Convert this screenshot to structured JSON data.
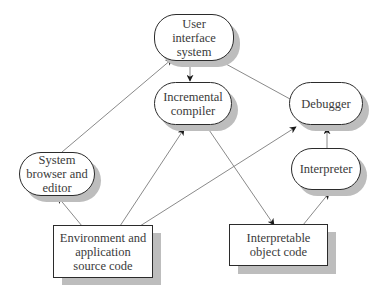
{
  "diagram": {
    "nodes": {
      "ui": {
        "label": "User\ninterface\nsystem",
        "shape": "pill"
      },
      "compiler": {
        "label": "Incremental\ncompiler",
        "shape": "pill"
      },
      "debugger": {
        "label": "Debugger",
        "shape": "pill"
      },
      "browser": {
        "label": "System\nbrowser and\neditor",
        "shape": "pill"
      },
      "interpreter": {
        "label": "Interpreter",
        "shape": "pill"
      },
      "source": {
        "label": "Environment and\napplication\nsource code",
        "shape": "rect"
      },
      "objcode": {
        "label": "Interpretable\nobject code",
        "shape": "rect"
      }
    },
    "edges": [
      {
        "from": "System browser and editor",
        "to": "User interface system"
      },
      {
        "from": "User interface system",
        "to": "Incremental compiler"
      },
      {
        "from": "Debugger",
        "to": "User interface system"
      },
      {
        "from": "Environment and application source code",
        "to": "System browser and editor"
      },
      {
        "from": "Environment and application source code",
        "to": "Incremental compiler"
      },
      {
        "from": "Environment and application source code",
        "to": "Debugger"
      },
      {
        "from": "Incremental compiler",
        "to": "Interpretable object code"
      },
      {
        "from": "Interpretable object code",
        "to": "Interpreter"
      },
      {
        "from": "Interpreter",
        "to": "Debugger"
      }
    ],
    "colors": {
      "border": "#2b2b2b",
      "shadow": "#bdbdbd",
      "edge": "#8a8a8a",
      "arrowhead": "#1a1a1a",
      "text": "#3a3a3a"
    }
  }
}
